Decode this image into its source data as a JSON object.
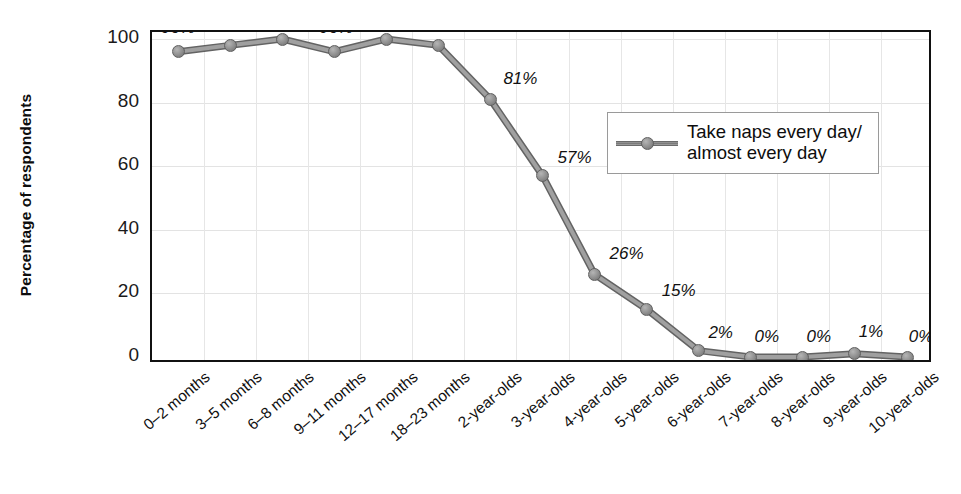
{
  "chart_data": {
    "type": "line",
    "title": "",
    "xlabel": "",
    "ylabel": "Percentage of respondents",
    "ylim": [
      0,
      100
    ],
    "yticks": [
      0,
      20,
      40,
      60,
      80,
      100
    ],
    "grid": true,
    "legend_position": "upper-right-inside",
    "categories": [
      "0–2 months",
      "3–5 months",
      "6–8 months",
      "9–11 months",
      "12–17 months",
      "18–23 months",
      "2-year-olds",
      "3-year-olds",
      "4-year-olds",
      "5-year-olds",
      "6-year-olds",
      "7-year-olds",
      "8-year-olds",
      "9-year-olds",
      "10-year-olds"
    ],
    "series": [
      {
        "name": "Take naps every day/almost every day",
        "values": [
          96,
          98,
          100,
          96,
          100,
          98,
          81,
          57,
          26,
          15,
          2,
          0,
          0,
          1,
          0
        ],
        "point_labels": [
          "96%",
          "98%",
          "100%",
          "96%",
          "100%",
          "98%",
          "81%",
          "57%",
          "26%",
          "15%",
          "2%",
          "0%",
          "0%",
          "1%",
          "0%"
        ],
        "color": "#8e8e8e",
        "marker": "circle"
      }
    ]
  },
  "legend": {
    "line1": "Take naps every day/",
    "line2": "almost every day"
  },
  "colors": {
    "series": "#8e8e8e",
    "frame": "#111111",
    "grid": "#e4e4e4",
    "text": "#111111"
  }
}
